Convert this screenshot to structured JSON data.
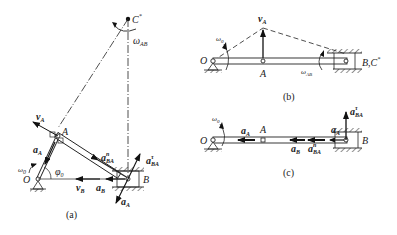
{
  "figure": {
    "panels": [
      {
        "id": "a",
        "caption": "(a)",
        "labels": {
          "C": "C",
          "C_star": "*",
          "omega_AB": "ω",
          "omega_AB_sub": "AB",
          "vA": "v",
          "vA_sub": "A",
          "A": "A",
          "aA_left": "a",
          "aA_left_sub": "A",
          "omega0": "ω",
          "omega0_sub": "0",
          "O": "O",
          "phi0": "φ",
          "phi0_sub": "0",
          "aBA_n": "a",
          "aBA_n_sub": "BA",
          "aBA_n_sup": "n",
          "aBA_t": "a",
          "aBA_t_sub": "BA",
          "aBA_t_sup": "τ",
          "B": "B",
          "vB": "v",
          "vB_sub": "B",
          "aB": "a",
          "aB_sub": "B",
          "aA_bottom": "a",
          "aA_bottom_sub": "A"
        }
      },
      {
        "id": "b",
        "caption": "(b)",
        "labels": {
          "vA": "v",
          "vA_sub": "A",
          "omega0": "ω",
          "omega0_sub": "0",
          "O": "O",
          "A": "A",
          "omega_AB": "ω",
          "omega_AB_sub": "AB",
          "BC": "B,C",
          "BC_star": "*"
        }
      },
      {
        "id": "c",
        "caption": "(c)",
        "labels": {
          "omega0": "ω",
          "omega0_sub": "0",
          "O": "O",
          "aA": "a",
          "aA_sub": "A",
          "A": "A",
          "aB": "a",
          "aB_sub": "B",
          "aBA_n": "a",
          "aBA_n_sub": "BA",
          "aBA_n_sup": "n",
          "aA_right": "a",
          "aA_right_sub": "A",
          "aBA_t": "a",
          "aBA_t_sub": "BA",
          "aBA_t_sup": "τ",
          "B": "B"
        }
      }
    ]
  }
}
